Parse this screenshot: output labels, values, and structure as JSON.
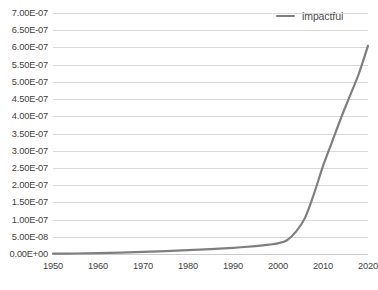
{
  "legend": {
    "position": "top-right",
    "entries": [
      {
        "label": "impactful",
        "color": "#7f7f7f",
        "marker": "line-swatch"
      }
    ]
  },
  "colors": {
    "series_line": "#7f7f7f",
    "gridline": "#d9d9d9",
    "baseline": "#cccccc",
    "tick_text": "#3f3f3f",
    "background": "#ffffff"
  },
  "chart_data": {
    "type": "line",
    "title": "",
    "subtitle": "",
    "xlabel": "",
    "ylabel": "",
    "grid": true,
    "legend_position": "top-right",
    "xlim": [
      1950,
      2020
    ],
    "ylim": [
      0.0,
      7e-07
    ],
    "xticks": [
      1950,
      1960,
      1970,
      1980,
      1990,
      2000,
      2010,
      2020
    ],
    "xtick_labels": [
      "1950",
      "1960",
      "1970",
      "1980",
      "1990",
      "2000",
      "2010",
      "2020"
    ],
    "yticks": [
      0.0,
      5e-08,
      1e-07,
      1.5e-07,
      2e-07,
      2.5e-07,
      3e-07,
      3.5e-07,
      4e-07,
      4.5e-07,
      5e-07,
      5.5e-07,
      6e-07,
      6.5e-07,
      7e-07
    ],
    "ytick_labels": [
      "0.00E+00",
      "5.00E-08",
      "1.00E-07",
      "1.50E-07",
      "2.00E-07",
      "2.50E-07",
      "3.00E-07",
      "3.50E-07",
      "4.00E-07",
      "4.50E-07",
      "5.00E-07",
      "5.50E-07",
      "6.00E-07",
      "6.50E-07",
      "7.00E-07"
    ],
    "series": [
      {
        "name": "impactful",
        "color": "#7f7f7f",
        "x": [
          1950,
          1955,
          1960,
          1965,
          1970,
          1975,
          1980,
          1985,
          1990,
          1995,
          1998,
          2000,
          2002,
          2004,
          2006,
          2008,
          2010,
          2012,
          2014,
          2016,
          2018,
          2020
        ],
        "y": [
          1e-09,
          1.5e-09,
          2.5e-09,
          4e-09,
          6e-09,
          8.5e-09,
          1.1e-08,
          1.4e-08,
          1.8e-08,
          2.3e-08,
          2.7e-08,
          3.1e-08,
          4e-08,
          6.5e-08,
          1.05e-07,
          1.75e-07,
          2.55e-07,
          3.25e-07,
          3.95e-07,
          4.6e-07,
          5.25e-07,
          6.05e-07
        ]
      }
    ]
  }
}
